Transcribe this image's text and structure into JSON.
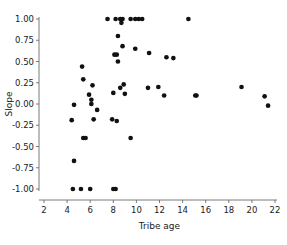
{
  "chart_data": {
    "type": "scatter",
    "title": "",
    "xlabel": "Tribe age",
    "ylabel": "Slope",
    "xlim": [
      2,
      22
    ],
    "ylim": [
      -1.0,
      1.0
    ],
    "grid": false,
    "legend": null,
    "marker": {
      "shape": "circle",
      "color": "#111111",
      "size": 3
    },
    "xticks": [
      2,
      4,
      6,
      8,
      10,
      12,
      14,
      16,
      18,
      20,
      22
    ],
    "xticklabels": [
      "2",
      "4",
      "6",
      "8",
      "10",
      "12",
      "14",
      "16",
      "18",
      "20",
      "22"
    ],
    "yticks": [
      -1.0,
      -0.75,
      -0.5,
      -0.25,
      0.0,
      0.25,
      0.5,
      0.75,
      1.0
    ],
    "yticklabels": [
      "-1.00",
      "-0.75",
      "-0.50",
      "-0.25",
      "0.00",
      "0.25",
      "0.50",
      "0.75",
      "1.00"
    ],
    "x": [
      7.5,
      8.2,
      8.6,
      8.8,
      9.5,
      9.9,
      10.2,
      10.5,
      14.5,
      8.4,
      8.8,
      9.9,
      8.1,
      8.3,
      11.1,
      12.6,
      13.2,
      5.3,
      5.4,
      8.4,
      6.2,
      6.1,
      8.0,
      8.6,
      8.9,
      9.0,
      8.7,
      4.6,
      6.1,
      6.6,
      5.9,
      11.0,
      11.9,
      12.4,
      15.1,
      15.2,
      19.1,
      21.1,
      21.4,
      4.4,
      6.3,
      7.9,
      8.3,
      5.4,
      5.6,
      9.5,
      4.6,
      4.5,
      5.2,
      6.0,
      8.0,
      8.2
    ],
    "y": [
      1.0,
      1.0,
      1.0,
      1.0,
      1.0,
      1.0,
      1.0,
      1.0,
      1.0,
      0.8,
      0.68,
      0.65,
      0.58,
      0.58,
      0.6,
      0.55,
      0.54,
      0.44,
      0.29,
      0.5,
      0.22,
      0.05,
      0.13,
      0.19,
      0.23,
      0.12,
      0.955,
      -0.01,
      0.0,
      -0.07,
      0.11,
      0.19,
      0.2,
      0.1,
      0.1,
      0.1,
      0.2,
      0.09,
      -0.02,
      -0.19,
      -0.18,
      -0.18,
      -0.2,
      -0.4,
      -0.4,
      -0.4,
      -0.67,
      -1.0,
      -1.0,
      -1.0,
      -1.0,
      -1.0
    ],
    "n_points": 52
  },
  "colors": {
    "marker": "#111111",
    "axis": "#6b6b6b",
    "text": "#1a1a1a",
    "background": "#ffffff"
  }
}
